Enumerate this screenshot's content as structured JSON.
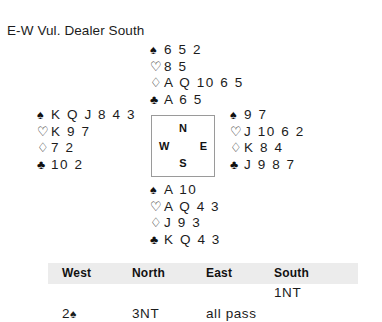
{
  "title": "E-W Vul. Dealer South",
  "suits": {
    "spade": "♠",
    "heart": "♡",
    "diamond": "♢",
    "club": "♣"
  },
  "compass": {
    "north": "N",
    "south": "S",
    "west": "W",
    "east": "E"
  },
  "hands": {
    "north": {
      "label": "North",
      "spades": "6 5 2",
      "hearts": "8 5",
      "diamonds": "A Q 10 6 5",
      "clubs": "A 6 5"
    },
    "west": {
      "label": "West",
      "spades": "K Q J 8 4 3",
      "hearts": "K 9 7",
      "diamonds": "7 2",
      "clubs": "10 2"
    },
    "east": {
      "label": "East",
      "spades": "9 7",
      "hearts": "J 10 6 2",
      "diamonds": "K 8 4",
      "clubs": "J 9 8 7"
    },
    "south": {
      "label": "South",
      "spades": "A 10",
      "hearts": "A Q 4 3",
      "diamonds": "J 9 3",
      "clubs": "K Q 4 3"
    }
  },
  "auction": {
    "headers": {
      "west": "West",
      "north": "North",
      "east": "East",
      "south": "South"
    },
    "row1": {
      "west": "",
      "north": "",
      "east": "",
      "south": "1NT"
    },
    "row2": {
      "west_num": "2",
      "west_suit": "♠",
      "north": "3NT",
      "east": "all pass",
      "south": ""
    }
  },
  "colors": {
    "header_band": "#ececec",
    "box_border": "#9a9a9a",
    "text": "#1c1c1c"
  }
}
